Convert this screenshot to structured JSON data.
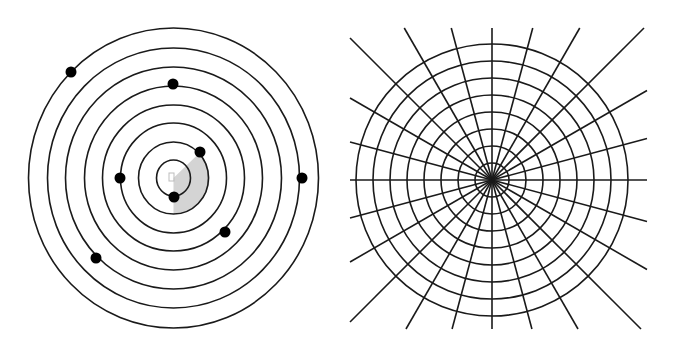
{
  "canvas": {
    "width": 673,
    "height": 352,
    "background": "#ffffff"
  },
  "colors": {
    "stroke": "#1a1a1a",
    "dot": "#000000",
    "wedge": "#d4d4d4",
    "center_marker": "#bdbdbd"
  },
  "left_diagram": {
    "name": "concentric-rings-with-dots",
    "center": [
      173.5,
      178
    ],
    "ring_count": 8,
    "ring_radii_x": [
      17,
      35,
      53,
      71,
      89,
      108,
      126,
      145
    ],
    "ring_radii_y": [
      18,
      36,
      55,
      73,
      92,
      111,
      130,
      150
    ],
    "stroke_width": 1.6,
    "dots": [
      {
        "ring": 8,
        "x": 71,
        "y": 72
      },
      {
        "ring": 5,
        "x": 173,
        "y": 84
      },
      {
        "ring": 2,
        "x": 200,
        "y": 152
      },
      {
        "ring": 3,
        "x": 120,
        "y": 178
      },
      {
        "ring": 1,
        "x": 174,
        "y": 197
      },
      {
        "ring": 7,
        "x": 302,
        "y": 178
      },
      {
        "ring": 4,
        "x": 225,
        "y": 232
      },
      {
        "ring": 6,
        "x": 96,
        "y": 258
      }
    ],
    "dot_radius": 5.5,
    "wedge": {
      "radius": 36,
      "start_angle_deg": -44,
      "end_angle_deg": 90
    },
    "center_marker": {
      "shape": "square",
      "x": 169,
      "y": 173,
      "w": 5,
      "h": 8
    }
  },
  "right_diagram": {
    "name": "polar-grid",
    "center": [
      492,
      180
    ],
    "circle_count": 8,
    "circle_radii": [
      17,
      34,
      51,
      68,
      85,
      102,
      119,
      136
    ],
    "radial_line_count": 24,
    "radial_step_deg": 15,
    "clip_box": {
      "x1": 350,
      "y1": 28,
      "x2": 647,
      "y2": 329
    },
    "stroke_width": 1.6
  }
}
